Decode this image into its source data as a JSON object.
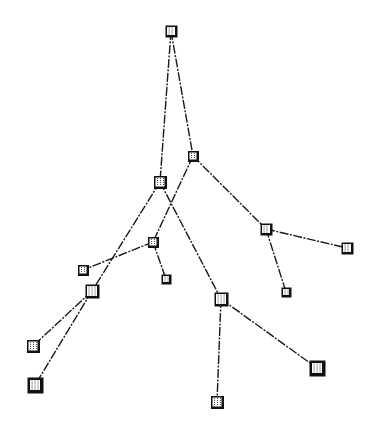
{
  "diagram": {
    "type": "tree",
    "width": 374,
    "height": 434,
    "colors": {
      "edge": "#1a1a1a",
      "node_border": "#111111",
      "node_fill": "#ffffff"
    },
    "nodes": [
      {
        "id": "A",
        "x": 171,
        "y": 31,
        "size": 11
      },
      {
        "id": "B",
        "x": 193,
        "y": 156,
        "size": 10
      },
      {
        "id": "C",
        "x": 160,
        "y": 182,
        "size": 12
      },
      {
        "id": "D",
        "x": 153,
        "y": 242,
        "size": 10
      },
      {
        "id": "E",
        "x": 266,
        "y": 229,
        "size": 11
      },
      {
        "id": "F",
        "x": 347,
        "y": 248,
        "size": 11
      },
      {
        "id": "G",
        "x": 286,
        "y": 292,
        "size": 9
      },
      {
        "id": "H",
        "x": 83,
        "y": 270,
        "size": 10
      },
      {
        "id": "I",
        "x": 166,
        "y": 279,
        "size": 9
      },
      {
        "id": "J",
        "x": 92,
        "y": 291,
        "size": 13
      },
      {
        "id": "K",
        "x": 221,
        "y": 299,
        "size": 13
      },
      {
        "id": "L",
        "x": 33,
        "y": 346,
        "size": 12
      },
      {
        "id": "M",
        "x": 35,
        "y": 385,
        "size": 15
      },
      {
        "id": "N",
        "x": 317,
        "y": 368,
        "size": 15
      },
      {
        "id": "O",
        "x": 217,
        "y": 402,
        "size": 12
      }
    ],
    "edges": [
      [
        "A",
        "B"
      ],
      [
        "A",
        "C"
      ],
      [
        "B",
        "E"
      ],
      [
        "B",
        "D"
      ],
      [
        "E",
        "F"
      ],
      [
        "E",
        "G"
      ],
      [
        "D",
        "H"
      ],
      [
        "D",
        "I"
      ],
      [
        "C",
        "J"
      ],
      [
        "J",
        "L"
      ],
      [
        "J",
        "M"
      ],
      [
        "C",
        "K"
      ],
      [
        "K",
        "N"
      ],
      [
        "K",
        "O"
      ]
    ]
  }
}
